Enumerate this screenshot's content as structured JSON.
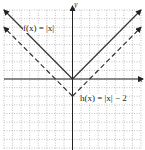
{
  "chart_data": {
    "type": "line",
    "title": "",
    "xlabel": "x",
    "ylabel": "y",
    "xlim": [
      -8,
      8
    ],
    "ylim": [
      -8,
      8
    ],
    "grid": true,
    "grid_style": "dotted",
    "tick_labels": false,
    "series": [
      {
        "name": "f(x) = |x|",
        "style": "solid",
        "color": "#333333",
        "points": [
          [
            -8,
            8
          ],
          [
            0,
            0
          ],
          [
            8,
            8
          ]
        ],
        "arrows": true
      },
      {
        "name": "h(x) = |x| − 2",
        "style": "dashed",
        "color": "#333333",
        "points": [
          [
            -8,
            6
          ],
          [
            0,
            -2
          ],
          [
            8,
            6
          ]
        ],
        "arrows": true
      }
    ],
    "annotations": [
      {
        "text": "f(x) = |x|",
        "anchor": "upper-left branch of f"
      },
      {
        "text": "h(x) = |x| − 2",
        "anchor": "right of h vertex, below x-axis"
      }
    ]
  },
  "labels": {
    "f": "f(x) = |x|",
    "h": "h(x) = |x| − 2",
    "x_axis": "x",
    "y_axis": "y"
  }
}
